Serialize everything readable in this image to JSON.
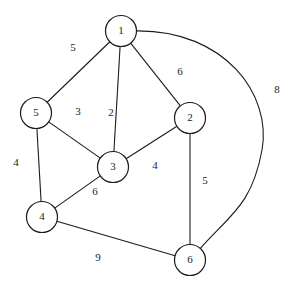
{
  "diagram": {
    "stroke_color": "#1b1b1b",
    "background_color": "#ffffff",
    "node_radius": 15.5
  },
  "chart_data": {
    "type": "diagram",
    "graph_kind": "weighted-undirected-graph",
    "nodes": [
      {
        "id": "1",
        "label": "1",
        "x": 121,
        "y": 31
      },
      {
        "id": "2",
        "label": "2",
        "x": 190,
        "y": 118
      },
      {
        "id": "3",
        "label": "3",
        "x": 113,
        "y": 167
      },
      {
        "id": "4",
        "label": "4",
        "x": 42,
        "y": 217
      },
      {
        "id": "5",
        "label": "5",
        "x": 36,
        "y": 113
      },
      {
        "id": "6",
        "label": "6",
        "x": 190,
        "y": 260
      }
    ],
    "edges": [
      {
        "from": "1",
        "to": "5",
        "weight": "5",
        "label_x": 73,
        "label_y": 48,
        "curved": false
      },
      {
        "from": "1",
        "to": "3",
        "weight": "2",
        "label_x": 111,
        "label_y": 113,
        "curved": false
      },
      {
        "from": "1",
        "to": "2",
        "weight": "6",
        "label_x": 180,
        "label_y": 72,
        "curved": false
      },
      {
        "from": "1",
        "to": "6",
        "weight": "8",
        "label_x": 277,
        "label_y": 90,
        "curved": true
      },
      {
        "from": "5",
        "to": "3",
        "weight": "3",
        "label_x": 78,
        "label_y": 112,
        "curved": false
      },
      {
        "from": "5",
        "to": "4",
        "weight": "4",
        "label_x": 16,
        "label_y": 163,
        "curved": false
      },
      {
        "from": "3",
        "to": "2",
        "weight": "4",
        "label_x": 155,
        "label_y": 166,
        "curved": false
      },
      {
        "from": "3",
        "to": "4",
        "weight": "6",
        "label_x": 95,
        "label_y": 192,
        "curved": false
      },
      {
        "from": "2",
        "to": "6",
        "weight": "5",
        "label_x": 205,
        "label_y": 181,
        "curved": false
      },
      {
        "from": "4",
        "to": "6",
        "weight": "9",
        "label_x": 98,
        "label_y": 258,
        "curved": false
      }
    ],
    "curve_control_points": {
      "1-6": {
        "c1x": 225,
        "c1y": 30,
        "c2x": 272,
        "c2y": 95,
        "c3x": 262,
        "c3y": 150,
        "c4x": 230,
        "c4y": 215
      }
    }
  }
}
